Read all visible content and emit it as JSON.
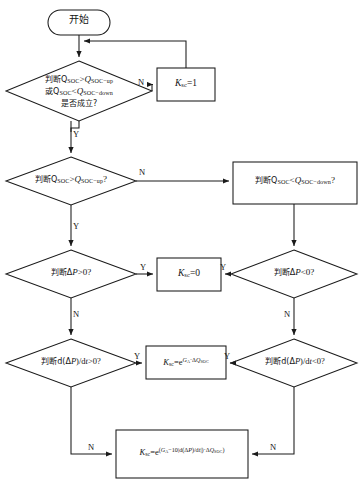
{
  "diagram": {
    "type": "flowchart",
    "background_color": "#ffffff",
    "line_color": "#1a1a1a",
    "text_color": "#141414"
  },
  "nodes": {
    "start": {
      "shape": "rounded-rectangle",
      "label": "开始"
    },
    "decision_soc_range": {
      "shape": "diamond",
      "line1": "判断Q",
      "line1_sub": "SOC",
      "line1_op": ">",
      "line1_right": "Q",
      "line1_right_sub": "SOC−up",
      "line2": "或Q",
      "line2_sub": "SOC",
      "line2_op": "<",
      "line2_right": "Q",
      "line2_right_sub": "SOC−down",
      "line3": "是否成立?"
    },
    "ksc_1": {
      "shape": "rectangle",
      "label": "K",
      "label_sub": "sc",
      "label_value": "=1"
    },
    "decision_soc_up": {
      "shape": "diamond",
      "prefix": "判断Q",
      "prefix_sub": "SOC",
      "op": ">",
      "right": "Q",
      "right_sub": "SOC−up",
      "suffix": "?"
    },
    "decision_soc_down": {
      "shape": "rectangle",
      "prefix": "判断Q",
      "prefix_sub": "SOC",
      "op": "<",
      "right": "Q",
      "right_sub": "SOC−down",
      "suffix": "?"
    },
    "decision_dp_gt0": {
      "shape": "diamond",
      "prefix": "判断Δ",
      "var": "P",
      "op": ">",
      "suffix": "0?"
    },
    "ksc_0": {
      "shape": "rectangle",
      "label": "K",
      "label_sub": "sc",
      "label_value": "=0"
    },
    "decision_dp_lt0": {
      "shape": "diamond",
      "prefix": "判断Δ",
      "var": "P",
      "op": "<",
      "suffix": "0?"
    },
    "decision_ddp_gt0": {
      "shape": "diamond",
      "prefix": "判断d(Δ",
      "var": "P",
      "mid": ")/d",
      "var2": "t",
      "op": ">",
      "suffix": "0?"
    },
    "ksc_exp": {
      "shape": "rectangle",
      "label": "K",
      "label_sub": "sc",
      "eq": "=e",
      "exp_base": "G",
      "exp_base_sub": "A",
      "exp_dot": "·Δ",
      "exp_q": "Q",
      "exp_q_sub": "SOC"
    },
    "decision_ddp_lt0": {
      "shape": "diamond",
      "prefix": "判断d(Δ",
      "var": "P",
      "mid": ")/d",
      "var2": "t",
      "op": "<",
      "suffix": "0?"
    },
    "ksc_exp_full": {
      "shape": "rectangle",
      "label": "K",
      "label_sub": "sc",
      "eq": "=e",
      "exp_open": "(",
      "exp_g": "G",
      "exp_g_sub": "A",
      "exp_minus": "−10|d(Δ",
      "exp_p": "P",
      "exp_mid": ")/d",
      "exp_t": "t",
      "exp_close": "|)·Δ",
      "exp_q": "Q",
      "exp_q_sub": "SOC",
      "exp_end": ")"
    }
  },
  "edge_labels": {
    "n_top": "N",
    "y_row1": "Y",
    "n_row2": "N",
    "y_row2": "Y",
    "y_row3_left": "Y",
    "y_row3_right": "Y",
    "n_row3_left": "N",
    "n_row3_right": "N",
    "y_row4_left": "Y",
    "y_row4_right": "Y",
    "n_row4_left": "N",
    "n_row4_right": "N"
  }
}
